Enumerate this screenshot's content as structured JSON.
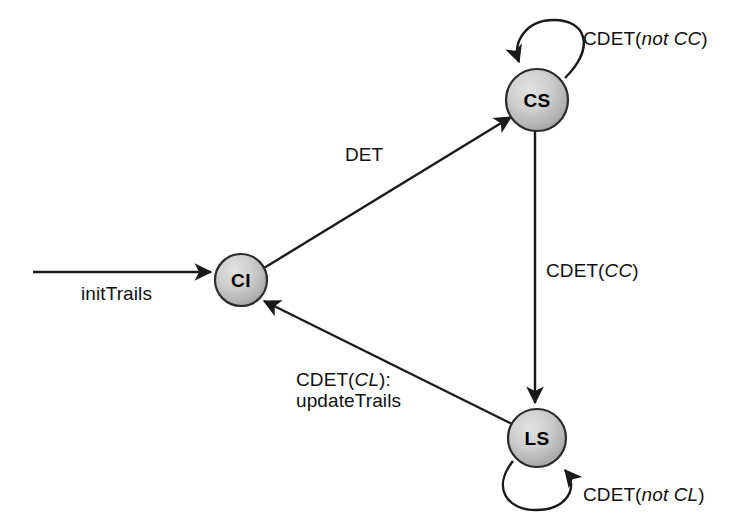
{
  "diagram": {
    "background_color": "#ffffff",
    "line_color": "#1a1a1a",
    "node_fill_light": "#d8d8d8",
    "node_fill_dark": "#9a9a9a",
    "node_stroke": "#2b2b2b",
    "label_color": "#111111",
    "nodes": [
      {
        "id": "CI",
        "label": "CI",
        "cx": 241,
        "cy": 280,
        "r": 26
      },
      {
        "id": "CS",
        "label": "CS",
        "cx": 537,
        "cy": 100,
        "r": 31
      },
      {
        "id": "LS",
        "label": "LS",
        "cx": 537,
        "cy": 438,
        "r": 29
      }
    ],
    "labels": {
      "init": "initTrails",
      "ci_to_cs": "DET",
      "cs_self_prefix": "CDET(",
      "cs_self_italic": "not CC",
      "cs_self_suffix": ")",
      "cs_to_ls_prefix": "CDET(",
      "cs_to_ls_italic": "CC",
      "cs_to_ls_suffix": ")",
      "ls_self_prefix": "CDET(",
      "ls_self_italic": "not CL",
      "ls_self_suffix": ")",
      "ls_to_ci_prefix": "CDET(",
      "ls_to_ci_italic": "CL",
      "ls_to_ci_suffix": "):",
      "ls_to_ci_line2": "updateTrails"
    }
  }
}
